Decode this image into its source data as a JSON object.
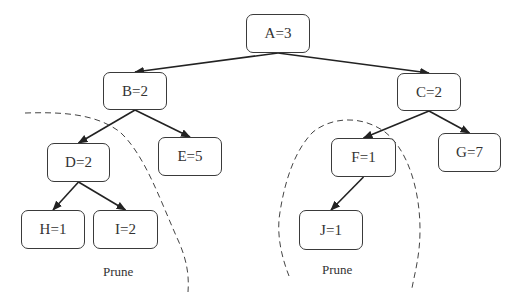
{
  "diagram": {
    "type": "tree",
    "nodes": [
      {
        "id": "A",
        "label": "A=3",
        "x": 246,
        "y": 14,
        "w": 64,
        "h": 39
      },
      {
        "id": "B",
        "label": "B=2",
        "x": 103,
        "y": 72,
        "w": 64,
        "h": 38
      },
      {
        "id": "C",
        "label": "C=2",
        "x": 397,
        "y": 73,
        "w": 64,
        "h": 38
      },
      {
        "id": "D",
        "label": "D=2",
        "x": 47,
        "y": 143,
        "w": 63,
        "h": 39
      },
      {
        "id": "E",
        "label": "E=5",
        "x": 158,
        "y": 137,
        "w": 64,
        "h": 39
      },
      {
        "id": "F",
        "label": "F=1",
        "x": 331,
        "y": 138,
        "w": 65,
        "h": 39
      },
      {
        "id": "G",
        "label": "G=7",
        "x": 438,
        "y": 133,
        "w": 63,
        "h": 39
      },
      {
        "id": "H",
        "label": "H=1",
        "x": 21,
        "y": 210,
        "w": 64,
        "h": 39
      },
      {
        "id": "I",
        "label": "I=2",
        "x": 93,
        "y": 210,
        "w": 65,
        "h": 39
      },
      {
        "id": "J",
        "label": "J=1",
        "x": 299,
        "y": 210,
        "w": 64,
        "h": 40
      }
    ],
    "edges": [
      {
        "from": "A",
        "to": "B"
      },
      {
        "from": "A",
        "to": "C"
      },
      {
        "from": "B",
        "to": "D"
      },
      {
        "from": "B",
        "to": "E"
      },
      {
        "from": "C",
        "to": "F"
      },
      {
        "from": "C",
        "to": "G"
      },
      {
        "from": "D",
        "to": "H"
      },
      {
        "from": "D",
        "to": "I"
      },
      {
        "from": "F",
        "to": "J"
      }
    ],
    "prune_regions": [
      {
        "label": "Prune",
        "label_x": 103,
        "label_y": 264,
        "path": "M25,113 C60,112 95,113 120,132 C145,155 160,200 178,240 C188,262 189,278 188,292"
      },
      {
        "label": "Prune",
        "label_x": 322,
        "label_y": 262,
        "path": "M289,276 C282,258 276,235 280,212 C285,180 295,150 313,132 C330,118 360,114 385,132 C408,150 420,190 420,230 C420,255 415,272 412,288"
      }
    ]
  }
}
